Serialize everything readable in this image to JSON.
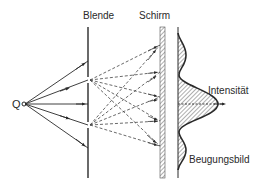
{
  "diagram": {
    "labels": {
      "source": "Q",
      "barrier": "Blende",
      "screen": "Schirm",
      "intensity": "Intensität",
      "pattern": "Beugungsbild"
    },
    "colors": {
      "line": "#2a2a2a",
      "hatch": "#777777",
      "background": "#ffffff"
    },
    "geometry": {
      "source": {
        "x": 25,
        "y": 104
      },
      "barrier_x": 88,
      "barrier_top": 27,
      "barrier_bottom": 178,
      "slits_y": [
        80,
        125
      ],
      "screen_x": 162,
      "intensity_baseline_x": 178
    },
    "incident_rays_end_y": [
      61,
      80,
      104,
      125,
      148
    ],
    "secondary_rays_target_y": [
      45,
      72,
      97,
      121,
      146
    ]
  }
}
